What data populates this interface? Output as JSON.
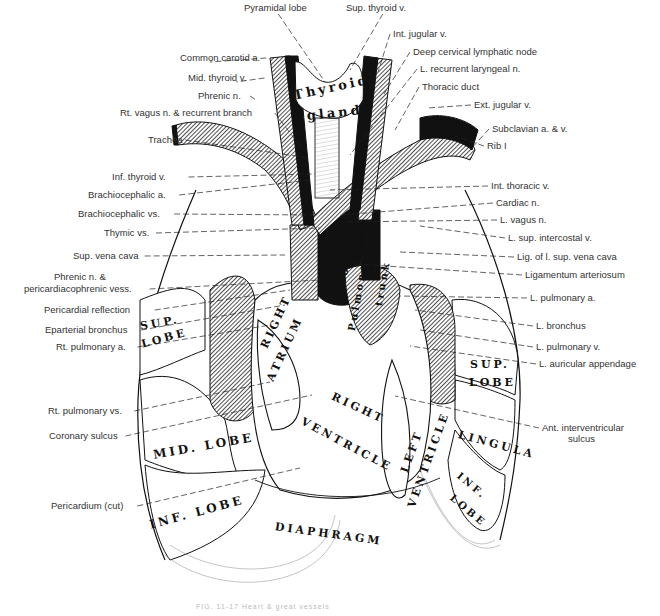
{
  "figure": {
    "caption": "FIG. 11-17  Heart & great vessels",
    "left_labels": [
      {
        "text": "Common carotid a.",
        "x": 180,
        "y": 52,
        "tx": 210,
        "ty": 62
      },
      {
        "text": "Mid. thyroid v.",
        "x": 188,
        "y": 72,
        "tx": 236,
        "ty": 82
      },
      {
        "text": "Phrenic n.",
        "x": 198,
        "y": 90,
        "tx": 256,
        "ty": 100
      },
      {
        "text": "Rt. vagus n. & recurrent branch",
        "x": 120,
        "y": 107,
        "tx": 300,
        "ty": 146
      },
      {
        "text": "Trachea",
        "x": 148,
        "y": 134,
        "tx": 310,
        "ty": 158
      },
      {
        "text": "Inf. thyroid v.",
        "x": 112,
        "y": 171,
        "tx": 315,
        "ty": 174
      },
      {
        "text": "Brachiocephalic a.",
        "x": 88,
        "y": 189,
        "tx": 310,
        "ty": 180
      },
      {
        "text": "Brachiocephalic vs.",
        "x": 78,
        "y": 208,
        "tx": 315,
        "ty": 215
      },
      {
        "text": "Thymic vs.",
        "x": 104,
        "y": 227,
        "tx": 320,
        "ty": 228
      },
      {
        "text": "Sup. vena cava",
        "x": 73,
        "y": 250,
        "tx": 285,
        "ty": 255
      },
      {
        "text": "Phrenic n. &",
        "x": 54,
        "y": 271,
        "tx": 0,
        "ty": 0
      },
      {
        "text": "pericardiacophrenic vess.",
        "x": 24,
        "y": 283,
        "tx": 320,
        "ty": 280
      },
      {
        "text": "Pericardial reflection",
        "x": 44,
        "y": 304,
        "tx": 290,
        "ty": 290
      },
      {
        "text": "Eparterial bronchus",
        "x": 45,
        "y": 324,
        "tx": 285,
        "ty": 305
      },
      {
        "text": "Rt. pulmonary a.",
        "x": 56,
        "y": 341,
        "tx": 270,
        "ty": 325
      },
      {
        "text": "Rt. pulmonary vs.",
        "x": 48,
        "y": 405,
        "tx": 270,
        "ty": 382
      },
      {
        "text": "Coronary sulcus",
        "x": 49,
        "y": 430,
        "tx": 312,
        "ty": 395
      },
      {
        "text": "Pericardium (cut)",
        "x": 51,
        "y": 500,
        "tx": 300,
        "ty": 468
      }
    ],
    "top_labels": [
      {
        "text": "Pyramidal lobe",
        "x": 244,
        "y": 2,
        "tx": 325,
        "ty": 82
      },
      {
        "text": "Sup. thyroid v.",
        "x": 346,
        "y": 2,
        "tx": 350,
        "ty": 70
      }
    ],
    "right_labels": [
      {
        "text": "Int. jugular v.",
        "x": 393,
        "y": 28,
        "tx": 378,
        "ty": 72
      },
      {
        "text": "Deep cervical lymphatic node",
        "x": 413,
        "y": 46,
        "tx": 384,
        "ty": 94
      },
      {
        "text": "L. recurrent laryngeal n.",
        "x": 420,
        "y": 63,
        "tx": 350,
        "ty": 155
      },
      {
        "text": "Thoracic duct",
        "x": 422,
        "y": 81,
        "tx": 395,
        "ty": 130
      },
      {
        "text": "Ext. jugular v.",
        "x": 474,
        "y": 99,
        "tx": 428,
        "ty": 108
      },
      {
        "text": "Subclavian a. & v.",
        "x": 492,
        "y": 123,
        "tx": 470,
        "ty": 150
      },
      {
        "text": "Rib I",
        "x": 487,
        "y": 140,
        "tx": 455,
        "ty": 136
      },
      {
        "text": "Int. thoracic v.",
        "x": 491,
        "y": 180,
        "tx": 330,
        "ty": 190
      },
      {
        "text": "Cardiac n.",
        "x": 496,
        "y": 197,
        "tx": 340,
        "ty": 215
      },
      {
        "text": "L. vagus n.",
        "x": 500,
        "y": 214,
        "tx": 345,
        "ty": 222
      },
      {
        "text": "L. sup. intercostal v.",
        "x": 508,
        "y": 232,
        "tx": 420,
        "ty": 226
      },
      {
        "text": "Lig. of l. sup. vena cava",
        "x": 517,
        "y": 251,
        "tx": 400,
        "ty": 252
      },
      {
        "text": "Ligamentum arteriosum",
        "x": 525,
        "y": 269,
        "tx": 355,
        "ty": 264
      },
      {
        "text": "L. pulmonary a.",
        "x": 530,
        "y": 292,
        "tx": 400,
        "ty": 296
      },
      {
        "text": "L. bronchus",
        "x": 536,
        "y": 320,
        "tx": 415,
        "ty": 310
      },
      {
        "text": "L. pulmonary v.",
        "x": 536,
        "y": 341,
        "tx": 420,
        "ty": 330
      },
      {
        "text": "L. auricular appendage",
        "x": 539,
        "y": 358,
        "tx": 410,
        "ty": 346
      },
      {
        "text": "Ant. interventricular",
        "x": 542,
        "y": 422,
        "tx": 395,
        "ty": 396
      },
      {
        "text": "sulcus",
        "x": 568,
        "y": 433,
        "tx": 0,
        "ty": 0
      }
    ],
    "organ_labels": [
      {
        "text": "Thyroid",
        "x": 292,
        "y": 88,
        "rot": -12,
        "size": 13
      },
      {
        "text": "gland",
        "x": 306,
        "y": 108,
        "rot": -6,
        "size": 13
      },
      {
        "text": "Aorta",
        "x": 334,
        "y": 285,
        "rot": -75,
        "size": 11
      },
      {
        "text": "Pulmonary",
        "x": 346,
        "y": 330,
        "rot": -80,
        "size": 10
      },
      {
        "text": "trunk",
        "x": 373,
        "y": 305,
        "rot": -80,
        "size": 10
      },
      {
        "text": "RIGHT",
        "x": 258,
        "y": 345,
        "rot": -65,
        "size": 11
      },
      {
        "text": "ATRIUM",
        "x": 264,
        "y": 378,
        "rot": -65,
        "size": 11
      },
      {
        "text": "RIGHT",
        "x": 335,
        "y": 390,
        "rot": 25,
        "size": 11
      },
      {
        "text": "VENTRICLE",
        "x": 305,
        "y": 415,
        "rot": 28,
        "size": 11
      },
      {
        "text": "LEFT",
        "x": 398,
        "y": 470,
        "rot": -70,
        "size": 11
      },
      {
        "text": "VENTRICLE",
        "x": 405,
        "y": 505,
        "rot": -70,
        "size": 11
      },
      {
        "text": "SUP.",
        "x": 139,
        "y": 320,
        "rot": -10,
        "size": 11
      },
      {
        "text": "LOBE",
        "x": 140,
        "y": 338,
        "rot": -15,
        "size": 11
      },
      {
        "text": "MID. LOBE",
        "x": 152,
        "y": 448,
        "rot": -10,
        "size": 12
      },
      {
        "text": "INF. LOBE",
        "x": 148,
        "y": 518,
        "rot": -15,
        "size": 12
      },
      {
        "text": "SUP.",
        "x": 470,
        "y": 358,
        "rot": 0,
        "size": 11
      },
      {
        "text": "LOBE",
        "x": 469,
        "y": 376,
        "rot": 0,
        "size": 11
      },
      {
        "text": "LINGULA",
        "x": 460,
        "y": 428,
        "rot": 15,
        "size": 11
      },
      {
        "text": "INF.",
        "x": 462,
        "y": 470,
        "rot": 40,
        "size": 10
      },
      {
        "text": "LOBE",
        "x": 455,
        "y": 492,
        "rot": 40,
        "size": 10
      },
      {
        "text": "DIAPHRAGM",
        "x": 276,
        "y": 520,
        "rot": 8,
        "size": 11
      }
    ],
    "colors": {
      "line": "#111111",
      "label_text": "#333333",
      "vessel_dark": "#111111",
      "vessel_hatch": "#555555",
      "background": "#ffffff"
    }
  }
}
